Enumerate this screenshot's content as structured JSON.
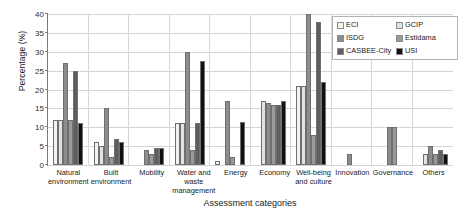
{
  "chart_data": {
    "type": "bar",
    "title": "",
    "xlabel": "Assessment categories",
    "ylabel": "Percentage (%)",
    "ylim": [
      0,
      40
    ],
    "ytick_step": 5,
    "yticks": [
      "0",
      "5",
      "10",
      "15",
      "20",
      "25",
      "30",
      "35",
      "40"
    ],
    "grid": "horizontal",
    "legend_position": "top-right",
    "categories": [
      "Natural environment",
      "Built environment",
      "Mobility",
      "Water and waste management",
      "Energy",
      "Economy",
      "Well-being and culture",
      "Innovation",
      "Governance",
      "Others"
    ],
    "series": [
      {
        "name": "ECI",
        "color": "#f2f2f2",
        "values": [
          12,
          6,
          0,
          11,
          1,
          0,
          21,
          0,
          0,
          0
        ]
      },
      {
        "name": "GCIP",
        "color": "#e2e2e2",
        "values": [
          12,
          5,
          0,
          11,
          0,
          17,
          21,
          0,
          0,
          3
        ]
      },
      {
        "name": "ISDG",
        "color": "#8c8c8c",
        "values": [
          27,
          15,
          4,
          30,
          17,
          16.5,
          40,
          3,
          10,
          5
        ]
      },
      {
        "name": "Estidama",
        "color": "#9a9a9a",
        "values": [
          12,
          2,
          3,
          4,
          2,
          16,
          8,
          0,
          10,
          3
        ]
      },
      {
        "name": "CASBEE-City",
        "color": "#5e5e5e",
        "values": [
          25,
          7,
          4.5,
          11,
          0,
          16,
          38,
          0,
          0,
          4
        ]
      },
      {
        "name": "USI",
        "color": "#111111",
        "values": [
          11,
          6,
          4.5,
          27.5,
          11.5,
          17,
          22,
          0,
          0,
          3
        ]
      }
    ]
  }
}
